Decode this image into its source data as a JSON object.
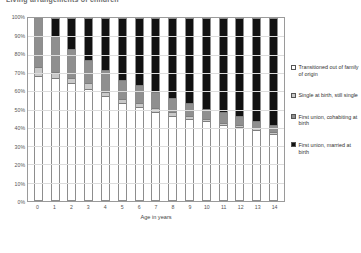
{
  "chart_data": {
    "type": "bar",
    "subtype": "100% stacked column",
    "title": "Living arrangements of children",
    "xlabel": "Age in years",
    "ylabel": "",
    "ylim": [
      0,
      100
    ],
    "ytick_labels": [
      "100%",
      "90%",
      "80%",
      "70%",
      "60%",
      "50%",
      "40%",
      "30%",
      "20%",
      "10%",
      "0%"
    ],
    "grid": true,
    "legend_position": "right",
    "categories": [
      "0",
      "1",
      "2",
      "3",
      "4",
      "5",
      "6",
      "7",
      "8",
      "9",
      "10",
      "11",
      "12",
      "13",
      "14"
    ],
    "series": [
      {
        "name": "First union, married at birth",
        "color": "#111111",
        "values": [
          68,
          67,
          64,
          61,
          57,
          53,
          51,
          48,
          46,
          44,
          43,
          41,
          40,
          38,
          36
        ]
      },
      {
        "name": "First union, cohabiting at birth",
        "color": "#8f8f8f",
        "values": [
          5,
          3,
          3,
          3,
          2,
          2,
          2,
          2,
          2,
          2,
          1,
          1,
          1,
          1,
          1
        ]
      },
      {
        "name": "Single at birth, still single",
        "color": "#c9c9c9",
        "values": [
          27,
          20,
          16,
          13,
          12,
          11,
          10,
          9,
          8,
          7,
          6,
          6,
          5,
          4,
          4
        ]
      },
      {
        "name": "Transitioned out of family of origin",
        "color": "#ffffff",
        "values": [
          0,
          10,
          17,
          23,
          29,
          34,
          37,
          41,
          44,
          47,
          50,
          52,
          54,
          57,
          59
        ]
      }
    ]
  },
  "legend": {
    "items": [
      {
        "label": "Transitioned out of family of origin",
        "swatch": "s0"
      },
      {
        "label": "Single at birth, still single",
        "swatch": "s1"
      },
      {
        "label": "First union, cohabiting at birth",
        "swatch": "s2"
      },
      {
        "label": "First union, married at birth",
        "swatch": "s3"
      }
    ]
  }
}
